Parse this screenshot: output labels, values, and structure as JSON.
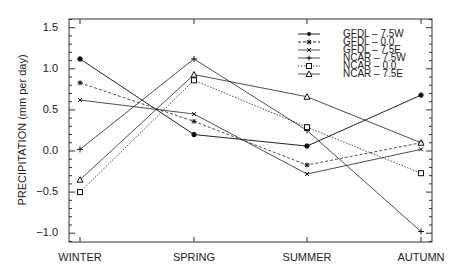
{
  "chart_data": {
    "type": "line",
    "title": "",
    "xlabel": "",
    "ylabel": "PRECIPITATION (mm per day)",
    "categories": [
      "WINTER",
      "SPRING",
      "SUMMER",
      "AUTUMN"
    ],
    "ylim": [
      -1.1,
      1.6
    ],
    "yticks": [
      -1.0,
      -0.5,
      0.0,
      0.5,
      1.0,
      1.5
    ],
    "ytick_labels": [
      "-1.0",
      "-0.5",
      "0.0",
      "0.5",
      "1.0",
      "1.5"
    ],
    "grid": false,
    "legend_position": "upper right",
    "series": [
      {
        "name": "GFDL - 7.5W",
        "marker": "filled-circle",
        "linestyle": "solid",
        "values": [
          1.12,
          0.2,
          0.06,
          0.68
        ]
      },
      {
        "name": "GFDL - 0.0",
        "marker": "asterisk",
        "linestyle": "dashed",
        "values": [
          0.83,
          0.36,
          -0.17,
          0.1
        ]
      },
      {
        "name": "GFDL - 7.5E",
        "marker": "x",
        "linestyle": "solid",
        "values": [
          0.62,
          0.45,
          -0.28,
          0.02
        ]
      },
      {
        "name": "NCAR - 7.5W",
        "marker": "plus",
        "linestyle": "solid",
        "values": [
          0.02,
          1.12,
          0.25,
          -0.98
        ]
      },
      {
        "name": "NCAR - 0.0",
        "marker": "open-square",
        "linestyle": "dotted",
        "values": [
          -0.5,
          0.86,
          0.29,
          -0.27
        ]
      },
      {
        "name": "NCAR - 7.5E",
        "marker": "open-triangle",
        "linestyle": "solid",
        "values": [
          -0.35,
          0.93,
          0.66,
          0.1
        ]
      }
    ]
  },
  "legend": {
    "items": [
      {
        "label": "GFDL  –  7.5W"
      },
      {
        "label": "GFDL  –  0.0"
      },
      {
        "label": "GFDL  –  7.5E"
      },
      {
        "label": "NCAR  –  7.5W"
      },
      {
        "label": "NCAR  –  0.0"
      },
      {
        "label": "NCAR  –  7.5E"
      }
    ]
  },
  "axes": {
    "ylabel": "PRECIPITATION (mm per day)",
    "x_labels": [
      "WINTER",
      "SPRING",
      "SUMMER",
      "AUTUMN"
    ],
    "y_labels": [
      "1.5",
      "1.0",
      "0.5",
      "0.0",
      "−0.5",
      "−1.0"
    ]
  }
}
